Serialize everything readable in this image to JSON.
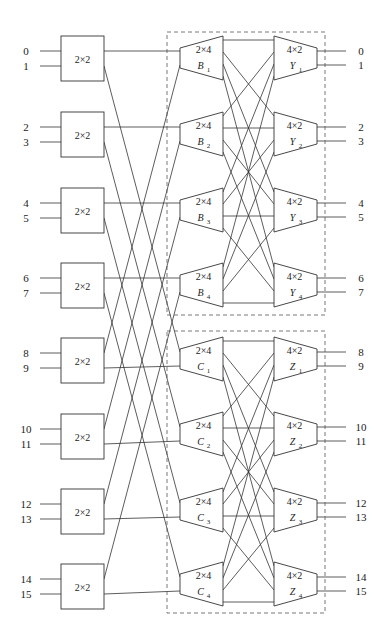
{
  "diagram": {
    "title": "",
    "inputs": [
      "0",
      "1",
      "2",
      "3",
      "4",
      "5",
      "6",
      "7",
      "8",
      "9",
      "10",
      "11",
      "12",
      "13",
      "14",
      "15"
    ],
    "outputs": [
      "0",
      "1",
      "2",
      "3",
      "4",
      "5",
      "6",
      "7",
      "8",
      "9",
      "10",
      "11",
      "12",
      "13",
      "14",
      "15"
    ],
    "input_switches": [
      {
        "label": "2×2"
      },
      {
        "label": "2×2"
      },
      {
        "label": "2×2"
      },
      {
        "label": "2×2"
      },
      {
        "label": "2×2"
      },
      {
        "label": "2×2"
      },
      {
        "label": "2×2"
      },
      {
        "label": "2×2"
      }
    ],
    "groups": [
      {
        "name": "upper",
        "demux": [
          {
            "size": "2×4",
            "letter": "B",
            "index": "1"
          },
          {
            "size": "2×4",
            "letter": "B",
            "index": "2"
          },
          {
            "size": "2×4",
            "letter": "B",
            "index": "3"
          },
          {
            "size": "2×4",
            "letter": "B",
            "index": "4"
          }
        ],
        "mux": [
          {
            "size": "4×2",
            "letter": "Y",
            "index": "1"
          },
          {
            "size": "4×2",
            "letter": "Y",
            "index": "2"
          },
          {
            "size": "4×2",
            "letter": "Y",
            "index": "3"
          },
          {
            "size": "4×2",
            "letter": "Y",
            "index": "4"
          }
        ]
      },
      {
        "name": "lower",
        "demux": [
          {
            "size": "2×4",
            "letter": "C",
            "index": "1"
          },
          {
            "size": "2×4",
            "letter": "C",
            "index": "2"
          },
          {
            "size": "2×4",
            "letter": "C",
            "index": "3"
          },
          {
            "size": "2×4",
            "letter": "C",
            "index": "4"
          }
        ],
        "mux": [
          {
            "size": "4×2",
            "letter": "Z",
            "index": "1"
          },
          {
            "size": "4×2",
            "letter": "Z",
            "index": "2"
          },
          {
            "size": "4×2",
            "letter": "Z",
            "index": "3"
          },
          {
            "size": "4×2",
            "letter": "Z",
            "index": "4"
          }
        ]
      }
    ],
    "colors": {
      "line": "#333333",
      "dash": "#555555",
      "background": "#ffffff"
    }
  }
}
